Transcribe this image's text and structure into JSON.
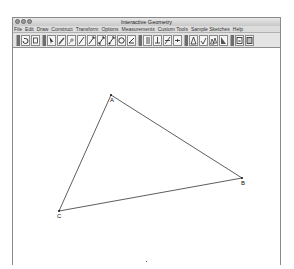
{
  "window": {
    "title": "Interactive Geometry"
  },
  "menubar": {
    "items": [
      "File",
      "Edit",
      "Draw",
      "Construct",
      "Transform",
      "Options",
      "Measurements",
      "Custom Tools",
      "Sample Sketches",
      "Help"
    ]
  },
  "toolbar": {
    "groups": [
      [
        "undo-icon",
        "redo-icon"
      ],
      [
        "select-arrow-icon",
        "pencil-icon",
        "point-icon",
        "segment-icon",
        "ray-icon",
        "line-icon",
        "vector-icon",
        "circle-icon",
        "angle-icon"
      ],
      [
        "parallel-icon",
        "perpendicular-icon",
        "bisector-icon",
        "midpoint-icon"
      ],
      [
        "reflect-icon",
        "rotate-icon",
        "translate-icon",
        "dilate-icon"
      ],
      [
        "calculator-icon",
        "table-icon"
      ]
    ]
  },
  "canvas": {
    "points": [
      {
        "label": "A",
        "x": 98,
        "y": 47
      },
      {
        "label": "B",
        "x": 229,
        "y": 130
      },
      {
        "label": "C",
        "x": 46,
        "y": 163
      }
    ],
    "segments": [
      [
        "A",
        "B"
      ],
      [
        "B",
        "C"
      ],
      [
        "C",
        "A"
      ]
    ],
    "line_color": "#333333"
  }
}
